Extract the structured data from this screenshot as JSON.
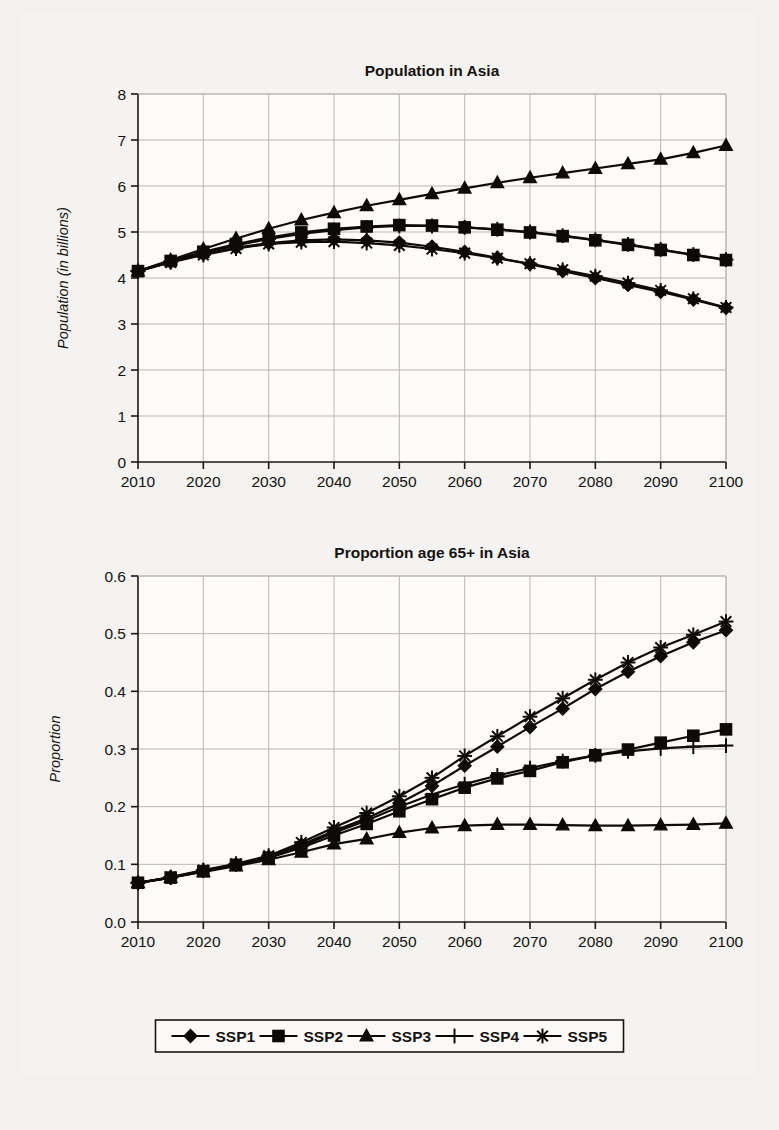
{
  "page": {
    "background_color": "#f2f1ef",
    "ink_color": "#0d0b09",
    "grid_color": "#b9b6b2"
  },
  "legend": {
    "name": "scenario-legend",
    "position": "bottom-center",
    "entries": [
      {
        "label": "SSP1",
        "marker": "diamond"
      },
      {
        "label": "SSP2",
        "marker": "square"
      },
      {
        "label": "SSP3",
        "marker": "triangle"
      },
      {
        "label": "SSP4",
        "marker": "plus"
      },
      {
        "label": "SSP5",
        "marker": "asterisk"
      }
    ]
  },
  "chart_data": [
    {
      "id": "population-in-asia",
      "type": "line",
      "title": "Population in Asia",
      "xlabel": "",
      "ylabel": "Population (in billions)",
      "xlim": [
        2010,
        2100
      ],
      "ylim": [
        0,
        8
      ],
      "xticks": [
        2010,
        2020,
        2030,
        2040,
        2050,
        2060,
        2070,
        2080,
        2090,
        2100
      ],
      "xtick_labels": [
        "2010",
        "2020",
        "2030",
        "2040",
        "2050",
        "2060",
        "2070",
        "2080",
        "2090",
        "2100"
      ],
      "yticks": [
        0,
        1,
        2,
        3,
        4,
        5,
        6,
        7,
        8
      ],
      "ytick_labels": [
        "0",
        "1",
        "2",
        "3",
        "4",
        "5",
        "6",
        "7",
        "8"
      ],
      "grid": true,
      "legend_position": "figure-bottom",
      "x": [
        2010,
        2015,
        2020,
        2025,
        2030,
        2035,
        2040,
        2045,
        2050,
        2055,
        2060,
        2065,
        2070,
        2075,
        2080,
        2085,
        2090,
        2095,
        2100
      ],
      "series": [
        {
          "name": "SSP1",
          "marker": "diamond",
          "values": [
            4.15,
            4.35,
            4.52,
            4.66,
            4.76,
            4.82,
            4.84,
            4.82,
            4.77,
            4.68,
            4.57,
            4.44,
            4.3,
            4.15,
            4.0,
            3.85,
            3.7,
            3.53,
            3.35
          ]
        },
        {
          "name": "SSP2",
          "marker": "square",
          "values": [
            4.15,
            4.37,
            4.57,
            4.74,
            4.88,
            4.99,
            5.07,
            5.12,
            5.15,
            5.14,
            5.1,
            5.05,
            4.99,
            4.91,
            4.82,
            4.72,
            4.61,
            4.5,
            4.39
          ]
        },
        {
          "name": "SSP3",
          "marker": "triangle",
          "values": [
            4.15,
            4.39,
            4.63,
            4.86,
            5.07,
            5.26,
            5.42,
            5.57,
            5.7,
            5.83,
            5.95,
            6.07,
            6.18,
            6.28,
            6.38,
            6.48,
            6.58,
            6.72,
            6.88
          ]
        },
        {
          "name": "SSP4",
          "marker": "plus",
          "values": [
            4.15,
            4.36,
            4.55,
            4.71,
            4.85,
            4.96,
            5.04,
            5.1,
            5.13,
            5.13,
            5.1,
            5.06,
            5.0,
            4.92,
            4.83,
            4.73,
            4.62,
            4.51,
            4.4
          ]
        },
        {
          "name": "SSP5",
          "marker": "asterisk",
          "values": [
            4.15,
            4.34,
            4.5,
            4.64,
            4.74,
            4.78,
            4.79,
            4.76,
            4.71,
            4.63,
            4.54,
            4.43,
            4.31,
            4.18,
            4.04,
            3.89,
            3.73,
            3.55,
            3.36
          ]
        }
      ]
    },
    {
      "id": "proportion-age-65-plus-in-asia",
      "type": "line",
      "title": "Proportion age 65+ in Asia",
      "xlabel": "",
      "ylabel": "Proportion",
      "xlim": [
        2010,
        2100
      ],
      "ylim": [
        0.0,
        0.6
      ],
      "xticks": [
        2010,
        2020,
        2030,
        2040,
        2050,
        2060,
        2070,
        2080,
        2090,
        2100
      ],
      "xtick_labels": [
        "2010",
        "2020",
        "2030",
        "2040",
        "2050",
        "2060",
        "2070",
        "2080",
        "2090",
        "2100"
      ],
      "yticks": [
        0.0,
        0.1,
        0.2,
        0.3,
        0.4,
        0.5,
        0.6
      ],
      "ytick_labels": [
        "0.0",
        "0.1",
        "0.2",
        "0.3",
        "0.4",
        "0.5",
        "0.6"
      ],
      "grid": true,
      "legend_position": "figure-bottom",
      "x": [
        2010,
        2015,
        2020,
        2025,
        2030,
        2035,
        2040,
        2045,
        2050,
        2055,
        2060,
        2065,
        2070,
        2075,
        2080,
        2085,
        2090,
        2095,
        2100
      ],
      "series": [
        {
          "name": "SSP1",
          "marker": "diamond",
          "values": [
            0.068,
            0.077,
            0.089,
            0.1,
            0.113,
            0.134,
            0.158,
            0.18,
            0.206,
            0.236,
            0.271,
            0.304,
            0.338,
            0.37,
            0.404,
            0.434,
            0.461,
            0.485,
            0.506
          ]
        },
        {
          "name": "SSP2",
          "marker": "square",
          "values": [
            0.068,
            0.077,
            0.088,
            0.099,
            0.111,
            0.129,
            0.15,
            0.17,
            0.192,
            0.213,
            0.233,
            0.249,
            0.262,
            0.277,
            0.289,
            0.299,
            0.311,
            0.323,
            0.334
          ]
        },
        {
          "name": "SSP3",
          "marker": "triangle",
          "values": [
            0.068,
            0.077,
            0.087,
            0.097,
            0.108,
            0.121,
            0.135,
            0.144,
            0.155,
            0.163,
            0.167,
            0.169,
            0.169,
            0.168,
            0.167,
            0.167,
            0.168,
            0.169,
            0.171
          ]
        },
        {
          "name": "SSP4",
          "marker": "plus",
          "values": [
            0.068,
            0.077,
            0.089,
            0.1,
            0.112,
            0.132,
            0.155,
            0.176,
            0.2,
            0.221,
            0.239,
            0.254,
            0.267,
            0.279,
            0.289,
            0.296,
            0.301,
            0.304,
            0.306
          ]
        },
        {
          "name": "SSP5",
          "marker": "asterisk",
          "values": [
            0.068,
            0.078,
            0.09,
            0.101,
            0.115,
            0.138,
            0.164,
            0.189,
            0.218,
            0.25,
            0.288,
            0.322,
            0.356,
            0.388,
            0.42,
            0.45,
            0.476,
            0.498,
            0.521
          ]
        }
      ]
    }
  ]
}
